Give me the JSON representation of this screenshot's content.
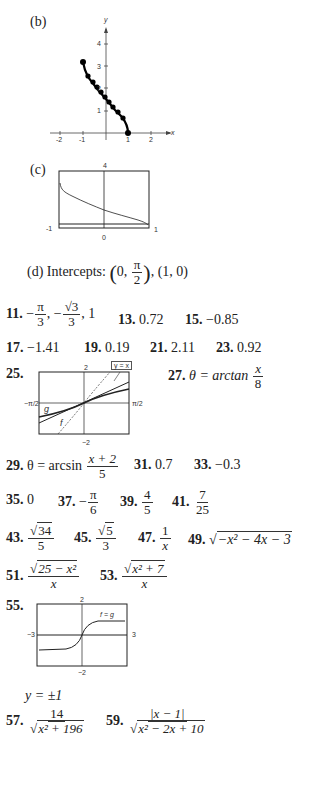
{
  "part_b": {
    "label": "(b)",
    "graph": {
      "x_axis_label": "x",
      "y_axis_label": "y",
      "x_ticks": [
        "-2",
        "-1",
        "1",
        "2"
      ],
      "y_ticks": [
        "1",
        "2",
        "3",
        "4"
      ]
    }
  },
  "part_c": {
    "label": "(c)",
    "window": {
      "ymax": "4",
      "xmin": "-1",
      "xmax": "1",
      "origin": "0"
    }
  },
  "part_d": {
    "label": "(d)",
    "text": "Intercepts:",
    "intercept1_prefix": "0,",
    "intercept1_num": "π",
    "intercept1_den": "2",
    "intercept2": ", (1, 0)"
  },
  "answers": {
    "a11": {
      "num": "11.",
      "p1": "−",
      "f1n": "π",
      "f1d": "3",
      "sep": ", −",
      "f2n": "√3",
      "f2d": "3",
      "tail": ", 1"
    },
    "a13": {
      "num": "13.",
      "val": "0.72"
    },
    "a15": {
      "num": "15.",
      "val": "−0.85"
    },
    "a17": {
      "num": "17.",
      "val": "−1.41"
    },
    "a19": {
      "num": "19.",
      "val": "0.19"
    },
    "a21": {
      "num": "21.",
      "val": "2.11"
    },
    "a23": {
      "num": "23.",
      "val": "0.92"
    },
    "a25": {
      "num": "25.",
      "graph": {
        "ymax": "2",
        "ymin": "−2",
        "xmin": "−π/2",
        "xmax": "π/2",
        "legend": "y = x",
        "label_g": "g",
        "label_f": "f"
      }
    },
    "a27": {
      "num": "27.",
      "lhs": "θ = arctan",
      "fn": "x",
      "fd": "8"
    },
    "a29": {
      "num": "29.",
      "lhs": "θ = arcsin",
      "fn": "x + 2",
      "fd": "5"
    },
    "a31": {
      "num": "31.",
      "val": "0.7"
    },
    "a33": {
      "num": "33.",
      "val": "−0.3"
    },
    "a35": {
      "num": "35.",
      "val": "0"
    },
    "a37": {
      "num": "37.",
      "sign": "−",
      "fn": "π",
      "fd": "6"
    },
    "a39": {
      "num": "39.",
      "fn": "4",
      "fd": "5"
    },
    "a41": {
      "num": "41.",
      "fn": "7",
      "fd": "25"
    },
    "a43": {
      "num": "43.",
      "fn": "34",
      "fd": "5"
    },
    "a45": {
      "num": "45.",
      "fn": "5",
      "fd": "3"
    },
    "a47": {
      "num": "47.",
      "fn": "1",
      "fd": "x"
    },
    "a49": {
      "num": "49.",
      "rad": "−x² − 4x − 3"
    },
    "a51": {
      "num": "51.",
      "fn": "25 − x²",
      "fd": "x"
    },
    "a53": {
      "num": "53.",
      "fn": "x² + 7",
      "fd": "x"
    },
    "a55": {
      "num": "55.",
      "graph": {
        "ymax": "2",
        "ymin": "−2",
        "xmin": "−3",
        "xmax": "3",
        "legend": "f = g"
      },
      "note": "y = ±1"
    },
    "a57": {
      "num": "57.",
      "fn": "14",
      "fd": "x² + 196"
    },
    "a59": {
      "num": "59.",
      "fn": "|x − 1|",
      "fd": "x² − 2x + 10"
    }
  }
}
